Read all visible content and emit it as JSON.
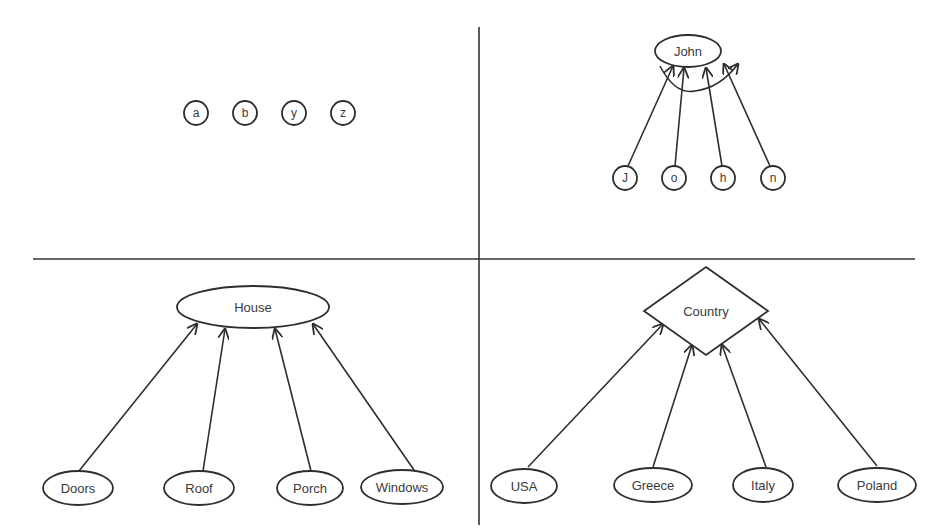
{
  "diagram": {
    "title": "",
    "colors": {
      "line": "#2e2e2e",
      "text": "#3a3a3a",
      "background": "#ffffff"
    },
    "dividers": {
      "vertical": {
        "x": 479,
        "y1": 27,
        "y2": 525
      },
      "horizontal": {
        "y": 259,
        "x1": 33,
        "x2": 915
      }
    },
    "quadrants": [
      {
        "id": "top-left",
        "description": "Unconnected individual letter nodes",
        "parent": null,
        "children": [
          {
            "label": "a",
            "shape": "circle",
            "cx": 196,
            "cy": 113,
            "r": 12
          },
          {
            "label": "b",
            "shape": "circle",
            "cx": 245,
            "cy": 113,
            "r": 12
          },
          {
            "label": "y",
            "shape": "circle",
            "cx": 294,
            "cy": 113,
            "r": 12
          },
          {
            "label": "z",
            "shape": "circle",
            "cx": 343,
            "cy": 113,
            "r": 12
          }
        ]
      },
      {
        "id": "top-right",
        "description": "Letters composing a word",
        "parent": {
          "label": "John",
          "shape": "ellipse",
          "cx": 688,
          "cy": 51,
          "rx": 33,
          "ry": 16
        },
        "children": [
          {
            "label": "J",
            "shape": "circle",
            "cx": 625,
            "cy": 178,
            "r": 12
          },
          {
            "label": "o",
            "shape": "circle",
            "cx": 674,
            "cy": 178,
            "r": 12
          },
          {
            "label": "h",
            "shape": "circle",
            "cx": 723,
            "cy": 178,
            "r": 12
          },
          {
            "label": "n",
            "shape": "circle",
            "cx": 773,
            "cy": 178,
            "r": 12
          }
        ],
        "edges": [
          {
            "from": [
              628,
              166
            ],
            "to": [
              673,
              66
            ]
          },
          {
            "from": [
              675,
              166
            ],
            "to": [
              684,
              68
            ]
          },
          {
            "from": [
              722,
              166
            ],
            "to": [
              706,
              68
            ]
          },
          {
            "from": [
              770,
              166
            ],
            "to": [
              724,
              64
            ]
          }
        ],
        "curved_arrow": {
          "path": "M 660 66 Q 675 95 695 91 Q 720 88 738 64"
        }
      },
      {
        "id": "bottom-left",
        "description": "Parts of a house",
        "parent": {
          "label": "House",
          "shape": "ellipse",
          "cx": 253,
          "cy": 307,
          "rx": 76,
          "ry": 21
        },
        "children": [
          {
            "label": "Doors",
            "shape": "ellipse",
            "cx": 78,
            "cy": 488,
            "rx": 35,
            "ry": 17
          },
          {
            "label": "Roof",
            "shape": "ellipse",
            "cx": 199,
            "cy": 488,
            "rx": 35,
            "ry": 17
          },
          {
            "label": "Porch",
            "shape": "ellipse",
            "cx": 310,
            "cy": 488,
            "rx": 33,
            "ry": 17
          },
          {
            "label": "Windows",
            "shape": "ellipse",
            "cx": 402,
            "cy": 487,
            "rx": 41,
            "ry": 17
          }
        ],
        "edges": [
          {
            "from": [
              79,
              471
            ],
            "to": [
              197,
              324
            ]
          },
          {
            "from": [
              203,
              471
            ],
            "to": [
              225,
              329
            ]
          },
          {
            "from": [
              311,
              471
            ],
            "to": [
              275,
              329
            ]
          },
          {
            "from": [
              414,
              470
            ],
            "to": [
              313,
              324
            ]
          }
        ]
      },
      {
        "id": "bottom-right",
        "description": "Categories of a country",
        "parent": {
          "label": "Country",
          "shape": "diamond",
          "cx": 706,
          "cy": 311,
          "hw": 62,
          "hh": 44
        },
        "children": [
          {
            "label": "USA",
            "shape": "ellipse",
            "cx": 524,
            "cy": 486,
            "rx": 33,
            "ry": 17
          },
          {
            "label": "Greece",
            "shape": "ellipse",
            "cx": 653,
            "cy": 485,
            "rx": 39,
            "ry": 17
          },
          {
            "label": "Italy",
            "shape": "ellipse",
            "cx": 763,
            "cy": 485,
            "rx": 30,
            "ry": 17
          },
          {
            "label": "Poland",
            "shape": "ellipse",
            "cx": 877,
            "cy": 485,
            "rx": 39,
            "ry": 17
          }
        ],
        "edges": [
          {
            "from": [
              528,
              467
            ],
            "to": [
              663,
              324
            ]
          },
          {
            "from": [
              653,
              467
            ],
            "to": [
              692,
              345
            ]
          },
          {
            "from": [
              766,
              467
            ],
            "to": [
              722,
              345
            ]
          },
          {
            "from": [
              877,
              466
            ],
            "to": [
              759,
              319
            ]
          }
        ]
      }
    ]
  }
}
